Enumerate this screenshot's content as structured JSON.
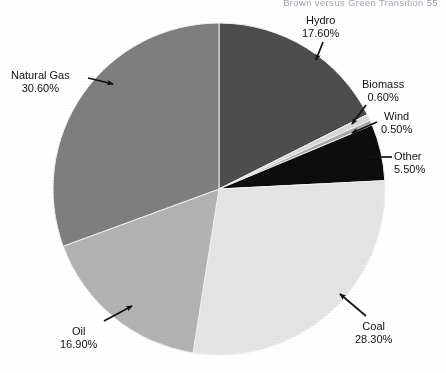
{
  "page": {
    "running_head": "Brown versus Green Transition   55"
  },
  "chart_data": {
    "type": "pie",
    "title": "",
    "xlabel": "",
    "ylabel": "",
    "legend_position": "none",
    "grid": false,
    "units": "percent",
    "start_angle_deg": 0,
    "direction": "clockwise",
    "center": {
      "x": 219,
      "y": 189
    },
    "radius": 166,
    "categories": [
      "Hydro",
      "Biomass",
      "Wind",
      "Other",
      "Coal",
      "Oil",
      "Natural Gas"
    ],
    "values": [
      17.6,
      0.6,
      0.5,
      5.5,
      28.3,
      16.9,
      30.6
    ],
    "total": 100.0,
    "slices": [
      {
        "name": "Hydro",
        "value": 17.6,
        "value_label": "17.60%",
        "color": "#4d4d4d"
      },
      {
        "name": "Biomass",
        "value": 0.6,
        "value_label": "0.60%",
        "color": "#d8d8d8"
      },
      {
        "name": "Wind",
        "value": 0.5,
        "value_label": "0.50%",
        "color": "#a8a8a8"
      },
      {
        "name": "Other",
        "value": 5.5,
        "value_label": "5.50%",
        "color": "#0d0d0d"
      },
      {
        "name": "Coal",
        "value": 28.3,
        "value_label": "28.30%",
        "color": "#e4e4e4"
      },
      {
        "name": "Oil",
        "value": 16.9,
        "value_label": "16.90%",
        "color": "#b2b2b2"
      },
      {
        "name": "Natural Gas",
        "value": 30.6,
        "value_label": "30.60%",
        "color": "#7e7e7e"
      }
    ]
  },
  "labels": {
    "hydro": {
      "name": "Hydro",
      "value": "17.60%"
    },
    "natural_gas": {
      "name": "Natural Gas",
      "value": "30.60%"
    },
    "biomass": {
      "name": "Biomass",
      "value": "0.60%"
    },
    "wind": {
      "name": "Wind",
      "value": "0.50%"
    },
    "other": {
      "name": "Other",
      "value": "5.50%"
    },
    "coal": {
      "name": "Coal",
      "value": "28.30%"
    },
    "oil": {
      "name": "Oil",
      "value": "16.90%"
    }
  }
}
